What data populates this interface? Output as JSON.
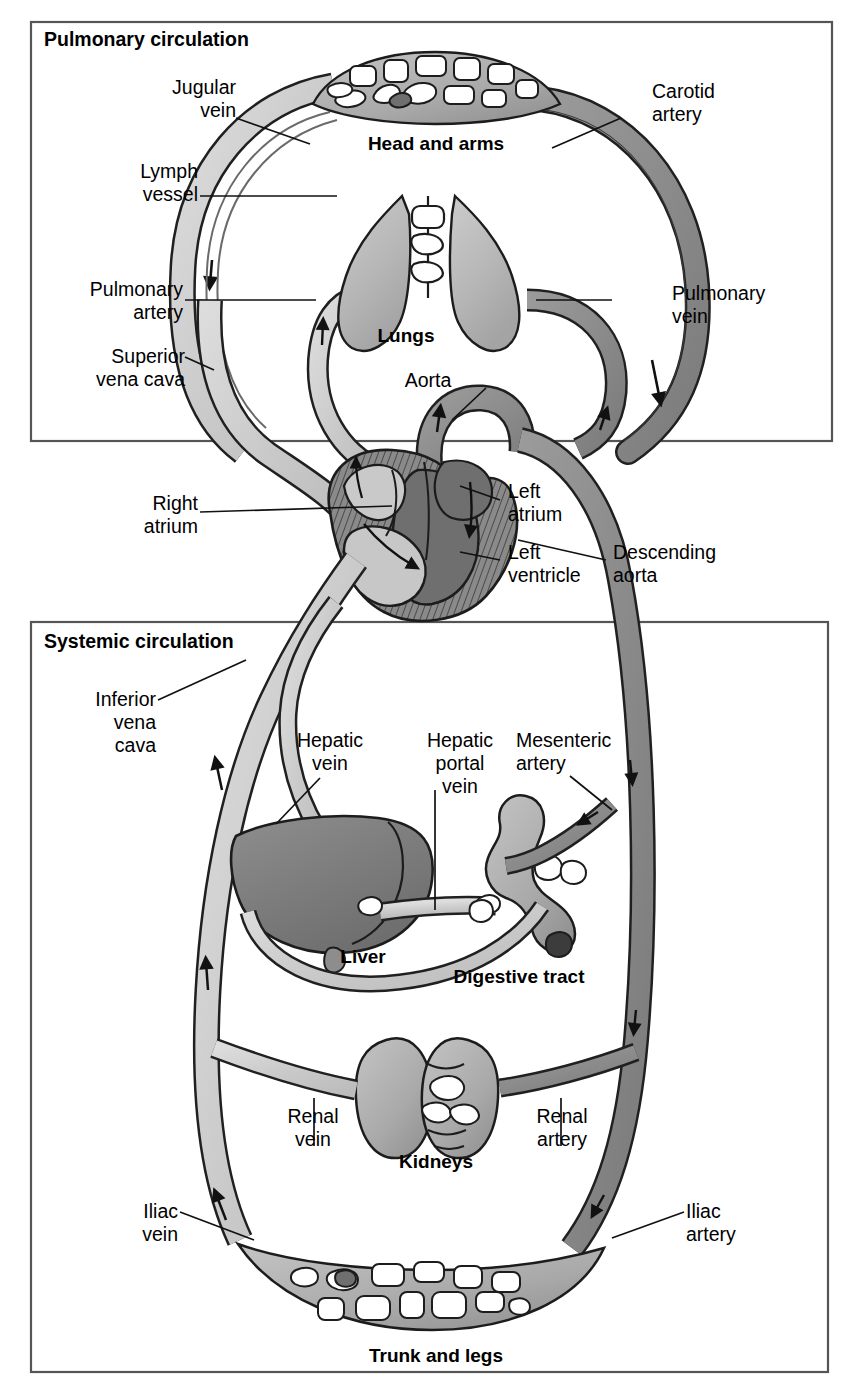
{
  "figure": {
    "type": "anatomical-diagram"
  },
  "boxes": [
    {
      "id": "pulmonary",
      "label": "Pulmonary circulation"
    },
    {
      "id": "systemic",
      "label": "Systemic circulation"
    }
  ],
  "organs": [
    {
      "id": "head-and-arms",
      "label": "Head and arms"
    },
    {
      "id": "lungs",
      "label": "Lungs"
    },
    {
      "id": "liver",
      "label": "Liver"
    },
    {
      "id": "digestive-tract",
      "label": "Digestive tract"
    },
    {
      "id": "kidneys",
      "label": "Kidneys"
    },
    {
      "id": "trunk-and-legs",
      "label": "Trunk and legs"
    }
  ],
  "vessels": [
    {
      "id": "jugular-vein",
      "label": "Jugular\nvein",
      "kind": "vein"
    },
    {
      "id": "lymph-vessel",
      "label": "Lymph\nvessel",
      "kind": "lymph"
    },
    {
      "id": "carotid-artery",
      "label": "Carotid\nartery",
      "kind": "artery"
    },
    {
      "id": "pulmonary-artery",
      "label": "Pulmonary\nartery",
      "kind": "vein-blood"
    },
    {
      "id": "pulmonary-vein",
      "label": "Pulmonary\nvein",
      "kind": "artery-blood"
    },
    {
      "id": "superior-vena-cava",
      "label": "Superior\nvena cava",
      "kind": "vein"
    },
    {
      "id": "aorta",
      "label": "Aorta",
      "kind": "artery"
    },
    {
      "id": "descending-aorta",
      "label": "Descending\naorta",
      "kind": "artery"
    },
    {
      "id": "inferior-vena-cava",
      "label": "Inferior\nvena\ncava",
      "kind": "vein"
    },
    {
      "id": "hepatic-vein",
      "label": "Hepatic\nvein",
      "kind": "vein"
    },
    {
      "id": "hepatic-portal-vein",
      "label": "Hepatic\nportal\nvein",
      "kind": "vein"
    },
    {
      "id": "mesenteric-artery",
      "label": "Mesenteric\nartery",
      "kind": "artery"
    },
    {
      "id": "renal-vein",
      "label": "Renal\nvein",
      "kind": "vein"
    },
    {
      "id": "renal-artery",
      "label": "Renal\nartery",
      "kind": "artery"
    },
    {
      "id": "iliac-vein",
      "label": "Iliac\nvein",
      "kind": "vein"
    },
    {
      "id": "iliac-artery",
      "label": "Iliac\nartery",
      "kind": "artery"
    }
  ],
  "heart_parts": [
    {
      "id": "right-atrium",
      "label": "Right\natrium"
    },
    {
      "id": "left-atrium",
      "label": "Left\natrium"
    },
    {
      "id": "left-ventricle",
      "label": "Left\nventricle"
    }
  ],
  "colors": {
    "artery_fill": "#8d8d8d",
    "vein_fill": "#c9c9c9",
    "organ_fill": "#b0b0b0",
    "lung_fill": "#bdbdbd",
    "liver_fill": "#7e7e7e",
    "heart_dark": "#7a7a7a",
    "outline": "#1a1a1a",
    "box_border": "#555555",
    "background": "#ffffff",
    "text": "#000000"
  }
}
